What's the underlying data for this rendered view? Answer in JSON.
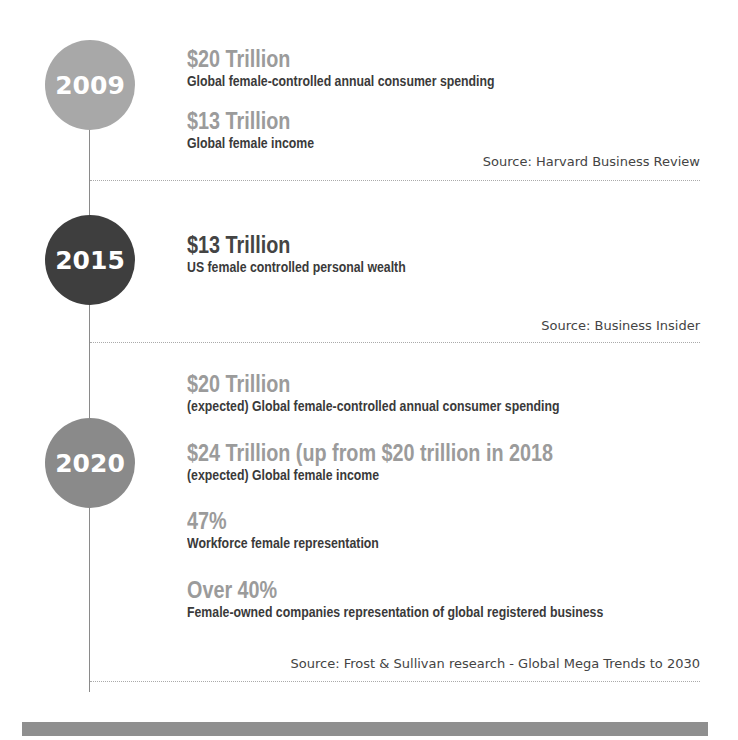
{
  "timeline": [
    {
      "year": "2009",
      "circle_color": "#a8a8a8",
      "stats": [
        {
          "value": "$20 Trillion",
          "description": "Global female-controlled annual consumer spending"
        },
        {
          "value": "$13 Trillion",
          "description": "Global female income"
        }
      ],
      "source": "Source: Harvard Business Review"
    },
    {
      "year": "2015",
      "circle_color": "#3e3e3e",
      "stats": [
        {
          "value": "$13 Trillion",
          "description": "US female controlled personal wealth"
        }
      ],
      "source": "Source: Business Insider"
    },
    {
      "year": "2020",
      "circle_color": "#8a8a8a",
      "stats": [
        {
          "value": "$20 Trillion",
          "description": "(expected) Global female-controlled annual consumer spending"
        },
        {
          "value": "$24 Trillion (up from $20 trillion in 2018",
          "description": "(expected) Global female income"
        },
        {
          "value": "47%",
          "description": "Workforce female representation"
        },
        {
          "value": "Over 40%",
          "description": "Female-owned companies representation of global registered business"
        }
      ],
      "source": "Source: Frost & Sullivan research - Global Mega Trends to 2030"
    }
  ],
  "colors": {
    "headline_gray": "#9b9b9b",
    "headline_dark": "#444444",
    "text_dark": "#3a3a3a",
    "bottom_bar": "#8f8f8f"
  }
}
